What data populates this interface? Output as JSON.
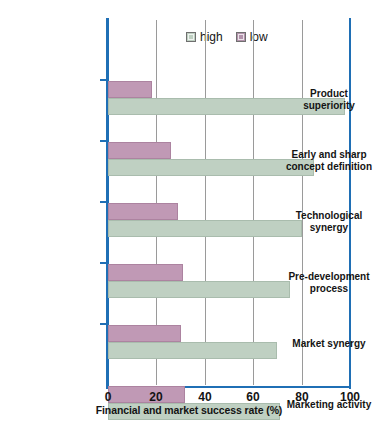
{
  "chart_data": {
    "type": "bar",
    "orientation": "horizontal",
    "title": "",
    "xlabel": "Financial and market success rate (%)",
    "ylabel": "",
    "xlim": [
      0,
      100
    ],
    "xticks": [
      0,
      20,
      40,
      60,
      80,
      100
    ],
    "grid": "vertical gridlines at 20, 40, 60, 80",
    "legend_position": "top-center",
    "categories": [
      "Product superiority",
      "Early and sharp concept definition",
      "Technological synergy",
      "Pre-development process",
      "Market synergy",
      "Marketing activity"
    ],
    "series": [
      {
        "name": "high",
        "color": "#bfd0c2",
        "values": [
          98,
          85,
          80,
          75,
          70,
          71
        ]
      },
      {
        "name": "low",
        "color": "#c099b5",
        "values": [
          18,
          26,
          29,
          31,
          30,
          32
        ]
      }
    ]
  },
  "axis": {
    "tick_labels": [
      "0",
      "20",
      "40",
      "60",
      "80",
      "100"
    ],
    "x_title": "Financial and market success rate (%)",
    "frame_color": "#1f6fb5",
    "grid_color": "#9a9a9a"
  },
  "legend": {
    "items": [
      {
        "label": "high",
        "swatch": "legend-swatch-high"
      },
      {
        "label": "low",
        "swatch": "legend-swatch-low"
      }
    ]
  },
  "categories": [
    {
      "line1": "Product",
      "line2": "superiority"
    },
    {
      "line1": "Early and sharp",
      "line2": "concept definition"
    },
    {
      "line1": "Technological",
      "line2": "synergy"
    },
    {
      "line1": "Pre-development",
      "line2": "process"
    },
    {
      "line1": "Market synergy",
      "line2": ""
    },
    {
      "line1": "Marketing activity",
      "line2": ""
    }
  ]
}
